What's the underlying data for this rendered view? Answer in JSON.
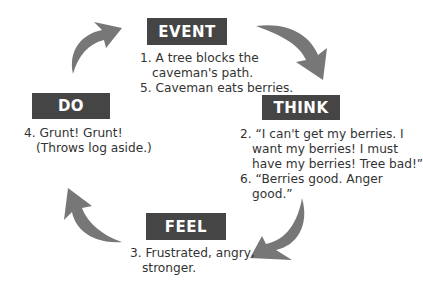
{
  "diagram": {
    "colors": {
      "box_bg": "#454545",
      "box_text": "#ffffff",
      "arrow": "#777777",
      "text": "#333333"
    },
    "nodes": {
      "event": {
        "label": "EVENT",
        "lines": [
          "1. A tree blocks the",
          "caveman's path.",
          "5. Caveman eats berries."
        ]
      },
      "think": {
        "label": "THINK",
        "lines": [
          "2. “I can't get my berries.  I",
          "want my berries!  I must",
          "have my berries! Tree bad!”",
          "6. “Berries good.  Anger",
          "good.”"
        ]
      },
      "feel": {
        "label": "FEEL",
        "lines": [
          "3. Frustrated, angry,",
          "stronger."
        ]
      },
      "do": {
        "label": "DO",
        "lines": [
          "4. Grunt! Grunt!",
          "(Throws log aside.)"
        ]
      }
    },
    "arrows": [
      "event-to-think",
      "think-to-feel",
      "feel-to-do",
      "do-to-event"
    ]
  }
}
